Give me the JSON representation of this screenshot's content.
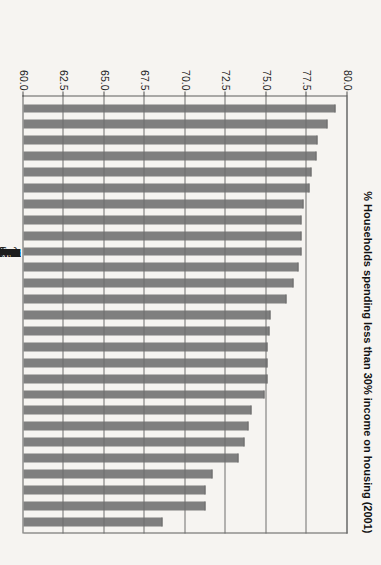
{
  "chart_data": {
    "type": "bar",
    "title": "",
    "xlabel": "",
    "ylabel": "% Households spending less than 30% income on housing (2001)",
    "ylim": [
      60.0,
      80.0
    ],
    "ytick_labels": [
      "60.0",
      "62.5",
      "65.0",
      "67.5",
      "70.0",
      "72.5",
      "75.0",
      "77.5",
      "80.0"
    ],
    "yticks": [
      60.0,
      62.5,
      65.0,
      67.5,
      70.0,
      72.5,
      75.0,
      77.5,
      80.0
    ],
    "grid": true,
    "legend": "none",
    "orientation": "vertical-bars-rotated-90",
    "bar_color": "#7f7f7f",
    "background_color": "#f6f4f1",
    "axis_color": "#5d5d5d",
    "categories": [
      "Winnipeg",
      "Regina",
      "Ottawa – Gatineau",
      "Moncton",
      "Chicoutimi – Jonquiere",
      "Kitchener",
      "Thunder Bay",
      "Quebec",
      "Windsor",
      "Edmonton",
      "Oshawa",
      "Calgary",
      "St. John's",
      "St. Catharines – Niagara",
      "Halifax",
      "Greater Sudbury",
      "Saskatoon",
      "Sherbrooke",
      "Hamilton",
      "Peterborough",
      "London",
      "Montreal",
      "Kingston",
      "Victoria",
      "Abbotsford",
      "Toronto",
      "Vancouver"
    ],
    "values": [
      79.2,
      78.7,
      78.1,
      78.0,
      77.7,
      77.6,
      77.2,
      77.1,
      77.1,
      77.1,
      76.9,
      76.6,
      76.2,
      75.2,
      75.1,
      75.0,
      75.0,
      75.0,
      74.8,
      74.0,
      73.8,
      73.6,
      73.2,
      71.6,
      71.2,
      71.2,
      68.5
    ]
  }
}
